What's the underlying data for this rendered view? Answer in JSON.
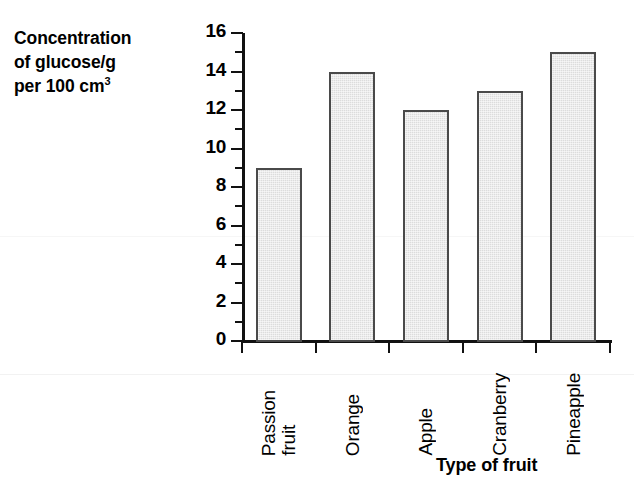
{
  "chart_data": {
    "type": "bar",
    "title": "",
    "categories": [
      "Passion fruit",
      "Orange",
      "Apple",
      "Cranberry",
      "Pineapple"
    ],
    "category_lines": [
      [
        "Passion",
        "fruit"
      ],
      [
        "Orange"
      ],
      [
        "Apple"
      ],
      [
        "Cranberry"
      ],
      [
        "Pineapple"
      ]
    ],
    "values": [
      9,
      14,
      12,
      13,
      15
    ],
    "xlabel": "Type of fruit",
    "ylabel": "Concentration of glucose/g per 100 cm3",
    "ylabel_lines": [
      "Concentration",
      "of glucose/g",
      "per 100 cm"
    ],
    "ylabel_superscript": "3",
    "ylim": [
      0,
      16
    ],
    "ytick_major_step": 2,
    "ytick_minor_step": 1,
    "ytick_labels": [
      "16",
      "14",
      "12",
      "10",
      "8",
      "6",
      "4",
      "2",
      "0"
    ],
    "ytick_values": [
      16,
      14,
      12,
      10,
      8,
      6,
      4,
      2,
      0
    ],
    "ytick_minor_values": [
      15,
      13,
      11,
      9,
      7,
      5,
      3,
      1
    ],
    "grid": false,
    "legend": false,
    "bar_fill_color": "#dcdcdc",
    "bar_border_color": "#4a4a4a",
    "axis_color": "#111111",
    "background_color": "#ffffff"
  }
}
